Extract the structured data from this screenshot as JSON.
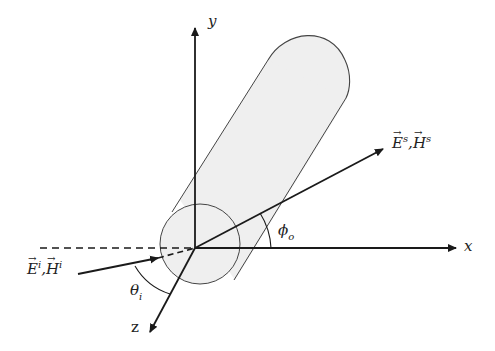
{
  "diagram": {
    "title": "",
    "axes": {
      "x_label": "x",
      "y_label": "y",
      "z_label": "z"
    },
    "incident_wave": {
      "E": "E",
      "H": "H",
      "superscript": "i",
      "separator": ","
    },
    "scattered_wave": {
      "E": "E",
      "H": "H",
      "superscript": "s",
      "separator": ","
    },
    "angles": {
      "incident": {
        "symbol": "θ",
        "subscript": "i"
      },
      "scattered": {
        "symbol": "ϕ",
        "subscript": "o"
      }
    },
    "colors": {
      "stroke": "#1a1a1a",
      "cylinder_fill": "#efefef",
      "cylinder_stroke": "#444444",
      "background": "#ffffff"
    }
  }
}
